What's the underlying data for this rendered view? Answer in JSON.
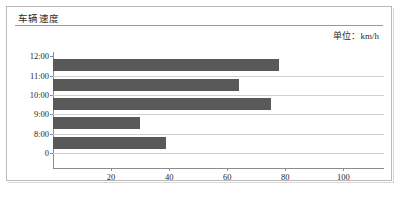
{
  "panel": {
    "title": "车辆速度",
    "unit_label": "单位：km/h"
  },
  "chart_data": {
    "type": "bar",
    "orientation": "horizontal",
    "title": "车辆速度",
    "xlabel": "",
    "ylabel": "",
    "unit": "km/h",
    "categories": [
      "12:00",
      "11:00",
      "10:00",
      "9:00",
      "8:00",
      "0"
    ],
    "values": [
      78,
      64,
      75,
      30,
      39,
      null
    ],
    "bars": [
      {
        "category": "12:00",
        "value": 78
      },
      {
        "category": "11:00",
        "value": 64
      },
      {
        "category": "10:00",
        "value": 75
      },
      {
        "category": "9:00",
        "value": 30
      },
      {
        "category": "8:00",
        "value": 39
      }
    ],
    "xticks": [
      20,
      40,
      60,
      80,
      100
    ],
    "xtick_labels": [
      "20",
      "40",
      "60",
      "80",
      "100"
    ],
    "ytick_labels": [
      "12:00",
      "11:00",
      "10:00",
      "9:00",
      "8:00",
      "0"
    ],
    "xlim": [
      0,
      114
    ],
    "grid": true,
    "legend": false,
    "bar_color": "#595959",
    "grid_color": "#cfcfcf",
    "axis_color": "#8c8c8c"
  }
}
